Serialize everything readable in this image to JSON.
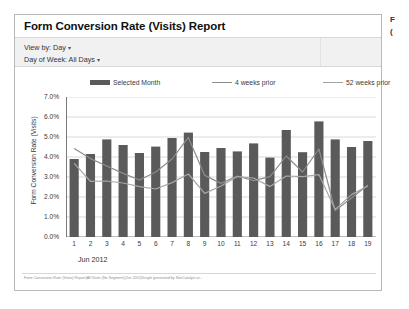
{
  "report": {
    "title": "Form Conversion Rate (Visits) Report",
    "controls": [
      {
        "label": "View by: Day",
        "caret": "▾"
      },
      {
        "label": "Day of Week: All Days",
        "caret": "▾"
      }
    ],
    "period_label": "Jun 2012",
    "footer": "Form Conversion Rate (Visits) Report|All Visits (No Segment)|Jun 2012|Graph generated by SiteCatalyst at...",
    "edge_text_1": "F",
    "edge_text_2": "("
  },
  "colors": {
    "bar": "#5a5a5a",
    "line_4w": "#8d8d8d",
    "line_52w": "#a8a8a8",
    "grid": "#d9d9d9",
    "axis": "#7a7a7a",
    "panel_border": "#b9b9b9",
    "controls_bg": "#f1f1f1"
  },
  "chart_data": {
    "type": "bar",
    "title": "Form Conversion Rate (Visits) Report",
    "xlabel": "Jun 2012",
    "ylabel": "Form Conversion Rate (Visits)",
    "categories": [
      "1",
      "2",
      "3",
      "4",
      "5",
      "6",
      "7",
      "8",
      "9",
      "10",
      "11",
      "12",
      "13",
      "14",
      "15",
      "16",
      "17",
      "18",
      "19"
    ],
    "ylim": [
      0,
      7
    ],
    "ytick_labels": [
      "0.0%",
      "1.0%",
      "2.0%",
      "3.0%",
      "4.0%",
      "5.0%",
      "6.0%",
      "7.0%"
    ],
    "ytick_values": [
      0,
      1,
      2,
      3,
      4,
      5,
      6,
      7
    ],
    "grid": true,
    "legend_position": "top",
    "series": [
      {
        "name": "Selected Month",
        "type": "bar",
        "color": "#5a5a5a",
        "values": [
          3.9,
          4.15,
          4.88,
          4.6,
          4.2,
          4.52,
          4.95,
          5.22,
          4.25,
          4.45,
          4.28,
          4.68,
          3.97,
          5.35,
          4.24,
          5.78,
          4.88,
          4.5,
          4.8
        ]
      },
      {
        "name": "4 weeks prior",
        "type": "line",
        "color": "#8d8d8d",
        "values": [
          4.42,
          3.92,
          3.55,
          3.18,
          2.85,
          3.25,
          3.9,
          4.98,
          3.08,
          2.68,
          3.05,
          2.82,
          3.02,
          4.05,
          3.25,
          4.4,
          1.32,
          1.95,
          2.6
        ]
      },
      {
        "name": "52 weeks prior",
        "type": "line",
        "color": "#a8a8a8",
        "values": [
          3.68,
          2.78,
          2.8,
          2.7,
          2.52,
          2.4,
          2.72,
          3.15,
          2.18,
          2.55,
          3.02,
          2.95,
          2.52,
          3.05,
          3.02,
          3.12,
          1.38,
          2.12,
          2.55
        ]
      }
    ]
  }
}
